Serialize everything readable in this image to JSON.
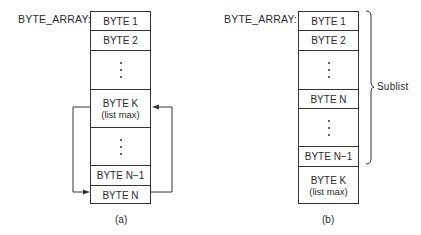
{
  "diagram_a": {
    "array_label": "BYTE_ARRAY:",
    "caption": "(a)",
    "cells": [
      {
        "type": "text",
        "label": "BYTE 1"
      },
      {
        "type": "text",
        "label": "BYTE 2"
      },
      {
        "type": "ellipsis"
      },
      {
        "type": "text",
        "label": "BYTE K",
        "sublabel": "(list max)"
      },
      {
        "type": "ellipsis"
      },
      {
        "type": "text",
        "label": "BYTE N−1"
      },
      {
        "type": "text",
        "label": "BYTE N"
      }
    ],
    "arrows": [
      {
        "from": "BYTE K",
        "to": "BYTE N",
        "side": "left"
      },
      {
        "from": "BYTE N",
        "to": "BYTE K",
        "side": "right"
      }
    ]
  },
  "diagram_b": {
    "array_label": "BYTE_ARRAY:",
    "caption": "(b)",
    "cells": [
      {
        "type": "text",
        "label": "BYTE 1"
      },
      {
        "type": "text",
        "label": "BYTE 2"
      },
      {
        "type": "ellipsis"
      },
      {
        "type": "text",
        "label": "BYTE N"
      },
      {
        "type": "ellipsis"
      },
      {
        "type": "text",
        "label": "BYTE N−1"
      },
      {
        "type": "text",
        "label": "BYTE K",
        "sublabel": "(list max)"
      }
    ],
    "brace": {
      "label": "Sublist",
      "spans": "BYTE 1 to BYTE N−1"
    }
  },
  "colors": {
    "line": "#333333",
    "text": "#2a2a2a",
    "background": "#ffffff"
  }
}
